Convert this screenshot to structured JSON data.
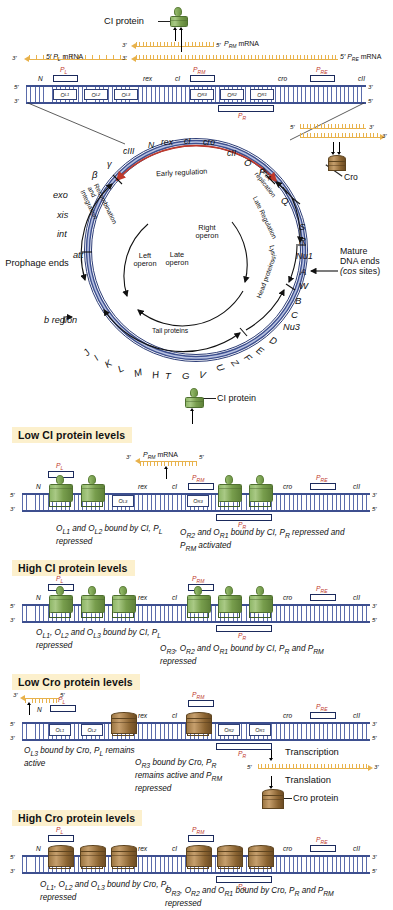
{
  "figure": {
    "colors": {
      "dna_blue": "#3d4f8f",
      "mrna_orange": "#e8b24c",
      "promoter_red": "#c0392b",
      "ci_green": "#7fa554",
      "cro_brown": "#9d7743",
      "header_cream": "#fcf0cd"
    }
  },
  "top_map": {
    "ci_protein_label": "CI protein",
    "mrna": [
      {
        "name": "P_L mRNA",
        "five": "5′",
        "three": "3′",
        "label_prime": "5′",
        "label_text": "P",
        "label_sub": "L",
        "label_tail": " mRNA"
      },
      {
        "name": "P_RM mRNA",
        "five": "5′",
        "three": "3′",
        "label_text": "P",
        "label_sub": "RM",
        "label_tail": " mRNA"
      },
      {
        "name": "P_RE mRNA",
        "five": "5′",
        "three": "3′",
        "label_text": "P",
        "label_sub": "RE",
        "label_tail": " mRNA"
      }
    ],
    "strand_ends": {
      "left_top": "5′",
      "left_bottom": "3′",
      "right_top": "3′",
      "right_bottom": "5′"
    },
    "genes": [
      "N",
      "rex",
      "cI",
      "cro",
      "cII"
    ],
    "promoters": [
      {
        "text": "P",
        "sub": "L"
      },
      {
        "text": "P",
        "sub": "RM"
      },
      {
        "text": "P",
        "sub": "RE"
      },
      {
        "text": "P",
        "sub": "R"
      }
    ],
    "operators": [
      {
        "o": "O",
        "sub": "L1"
      },
      {
        "o": "O",
        "sub": "L2"
      },
      {
        "o": "O",
        "sub": "L3"
      },
      {
        "o": "O",
        "sub": "R3"
      },
      {
        "o": "O",
        "sub": "R2"
      },
      {
        "o": "O",
        "sub": "R1"
      }
    ],
    "cro_callout": {
      "label": "Cro",
      "five": "5′",
      "three": "3′"
    }
  },
  "circle_map": {
    "top_genes": [
      "N",
      "rex",
      "cI",
      "cro",
      "cII",
      "O",
      "P",
      "Q"
    ],
    "left_genes": [
      "cIII",
      "γ",
      "β",
      "exo",
      "xis",
      "int",
      "att"
    ],
    "right_genes": [
      "S",
      "R",
      "Nu1",
      "A",
      "W",
      "B",
      "C",
      "Nu3",
      "D",
      "E",
      "F",
      "Z",
      "U"
    ],
    "bottom_genes": [
      "J",
      "I",
      "K",
      "L",
      "M",
      "H",
      "T",
      "G",
      "V"
    ],
    "arcs": [
      {
        "label": "Early regulation"
      },
      {
        "label": "DNA replication"
      },
      {
        "label": "Late Regulation"
      },
      {
        "label": "Lysis"
      },
      {
        "label": "Head proteins"
      },
      {
        "label": "Tail proteins"
      },
      {
        "label": "Recombination and Integration"
      },
      {
        "label": "Left operon"
      },
      {
        "label": "Right operon"
      },
      {
        "label": "Late operon"
      }
    ],
    "annotations": [
      {
        "label": "Prophage ends"
      },
      {
        "label": "b region"
      },
      {
        "label": "Mature DNA ends (cos sites)"
      },
      {
        "label": "Cro"
      }
    ]
  },
  "panels": [
    {
      "id": "low-ci",
      "heading": "Low CI protein levels",
      "protein": "CI protein",
      "protein_type": "ci",
      "mrna_label": {
        "text": "P",
        "sub": "RM",
        "tail": " mRNA"
      },
      "mrna_five": "5′",
      "mrna_three": "3′",
      "genes": [
        "N",
        "rex",
        "cI",
        "cro",
        "cII"
      ],
      "operators": [
        {
          "o": "O",
          "sub": "L1",
          "occupied": true
        },
        {
          "o": "O",
          "sub": "L2",
          "occupied": true
        },
        {
          "o": "O",
          "sub": "L3",
          "occupied": false
        },
        {
          "o": "O",
          "sub": "R3",
          "occupied": false
        },
        {
          "o": "O",
          "sub": "R2",
          "occupied": true
        },
        {
          "o": "O",
          "sub": "R1",
          "occupied": true
        }
      ],
      "promoters": [
        {
          "text": "P",
          "sub": "L"
        },
        {
          "text": "P",
          "sub": "RM"
        },
        {
          "text": "P",
          "sub": "RE"
        },
        {
          "text": "P",
          "sub": "R"
        }
      ],
      "caption_left": "O<sub>L1</sub> and O<sub>L2</sub> bound by CI, P<sub>L</sub> repressed",
      "caption_right": "O<sub>R2</sub> and O<sub>R1</sub> bound by CI, P<sub>R</sub> repressed and P<sub>RM</sub> activated"
    },
    {
      "id": "high-ci",
      "heading": "High CI protein levels",
      "protein_type": "ci",
      "genes": [
        "N",
        "rex",
        "cI",
        "cro",
        "cII"
      ],
      "operators": [
        {
          "o": "O",
          "sub": "L1",
          "occupied": true
        },
        {
          "o": "O",
          "sub": "L2",
          "occupied": true
        },
        {
          "o": "O",
          "sub": "L3",
          "occupied": true
        },
        {
          "o": "O",
          "sub": "R3",
          "occupied": true
        },
        {
          "o": "O",
          "sub": "R2",
          "occupied": true
        },
        {
          "o": "O",
          "sub": "R1",
          "occupied": true
        }
      ],
      "promoters": [
        {
          "text": "P",
          "sub": "L"
        },
        {
          "text": "P",
          "sub": "RM"
        },
        {
          "text": "P",
          "sub": "RE"
        },
        {
          "text": "P",
          "sub": "R"
        }
      ],
      "caption_left": "O<sub>L1</sub>, O<sub>L2</sub> and O<sub>L3</sub> bound by CI, P<sub>L</sub> repressed",
      "caption_right": "O<sub>R3</sub>, O<sub>R2</sub> and O<sub>R1</sub> bound by CI, P<sub>R</sub> and P<sub>RM</sub> repressed"
    },
    {
      "id": "low-cro",
      "heading": "Low Cro protein levels",
      "protein_type": "cro",
      "protein": "Cro protein",
      "transcription_label": "Transcription",
      "translation_label": "Translation",
      "mrna_five": "5′",
      "mrna_three": "3′",
      "left_mrna_five": "5′",
      "left_mrna_three": "3′",
      "genes": [
        "N",
        "rex",
        "cI",
        "cro",
        "cII"
      ],
      "operators": [
        {
          "o": "O",
          "sub": "L1",
          "occupied": false
        },
        {
          "o": "O",
          "sub": "L2",
          "occupied": false
        },
        {
          "o": "O",
          "sub": "L3",
          "occupied": true
        },
        {
          "o": "O",
          "sub": "R3",
          "occupied": true
        },
        {
          "o": "O",
          "sub": "R2",
          "occupied": false
        },
        {
          "o": "O",
          "sub": "R1",
          "occupied": false
        }
      ],
      "promoters": [
        {
          "text": "P",
          "sub": "L"
        },
        {
          "text": "P",
          "sub": "RM"
        },
        {
          "text": "P",
          "sub": "RE"
        },
        {
          "text": "P",
          "sub": "R"
        }
      ],
      "caption_left": "O<sub>L3</sub> bound by Cro, P<sub>L</sub> remains active",
      "caption_right": "O<sub>R3</sub> bound by Cro, P<sub>R</sub> remains active and P<sub>RM</sub> repressed"
    },
    {
      "id": "high-cro",
      "heading": "High Cro protein levels",
      "protein_type": "cro",
      "genes": [
        "N",
        "rex",
        "cI",
        "cro",
        "cII"
      ],
      "operators": [
        {
          "o": "O",
          "sub": "L1",
          "occupied": true
        },
        {
          "o": "O",
          "sub": "L2",
          "occupied": true
        },
        {
          "o": "O",
          "sub": "L3",
          "occupied": true
        },
        {
          "o": "O",
          "sub": "R3",
          "occupied": true
        },
        {
          "o": "O",
          "sub": "R2",
          "occupied": true
        },
        {
          "o": "O",
          "sub": "R1",
          "occupied": true
        }
      ],
      "promoters": [
        {
          "text": "P",
          "sub": "L"
        },
        {
          "text": "P",
          "sub": "RM"
        },
        {
          "text": "P",
          "sub": "RE"
        },
        {
          "text": "P",
          "sub": "R"
        }
      ],
      "caption_left": "O<sub>L1</sub>, O<sub>L2</sub> and O<sub>L3</sub> bound by Cro, P<sub>L</sub> repressed",
      "caption_right": "O<sub>R3</sub>, O<sub>R2</sub> and O<sub>R1</sub> bound by Cro, P<sub>R</sub> and P<sub>RM</sub> repressed"
    }
  ],
  "strand_ends": {
    "five": "5′",
    "three": "3′"
  }
}
